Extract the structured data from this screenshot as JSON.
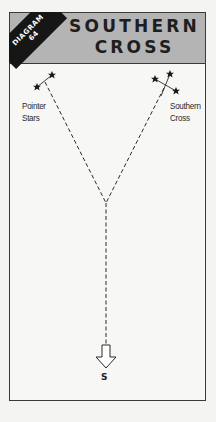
{
  "header": {
    "badge_line1": "DIAGRAM",
    "badge_line2": "64",
    "title_line1": "SOUTHERN",
    "title_line2": "CROSS"
  },
  "labels": {
    "pointer_line1": "Pointer",
    "pointer_line2": "Stars",
    "cross_line1": "Southern",
    "cross_line2": "Cross",
    "direction": "S"
  },
  "colors": {
    "header_bg": "#b4b4b4",
    "badge_bg": "#161616",
    "ink": "#1e1e1e",
    "paper": "#f7f7f5"
  },
  "diagram": {
    "pointer_stars": [
      {
        "x": 52,
        "y": 75
      },
      {
        "x": 37,
        "y": 87
      }
    ],
    "southern_cross_stars": [
      {
        "x": 155,
        "y": 79
      },
      {
        "x": 170,
        "y": 74
      },
      {
        "x": 176,
        "y": 91
      },
      {
        "x": 161,
        "y": 96
      }
    ],
    "junction": {
      "x": 106,
      "y": 203
    },
    "arrow_tip": {
      "x": 106,
      "y": 368
    }
  }
}
